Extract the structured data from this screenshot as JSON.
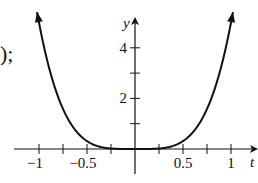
{
  "prefix_text": ");",
  "chart_data": {
    "type": "line",
    "title": "",
    "function": "y = 5t^4",
    "xlabel": "t",
    "ylabel": "y",
    "xlim": [
      -1.05,
      1.05
    ],
    "ylim": [
      0,
      5
    ],
    "x_ticks": [
      -1,
      -0.75,
      -0.5,
      -0.25,
      0.25,
      0.5,
      0.75,
      1
    ],
    "x_tick_labels": [
      "−1",
      "−0.5",
      "0.5",
      "1"
    ],
    "x_tick_label_values": [
      -1,
      -0.5,
      0.5,
      1
    ],
    "y_ticks": [
      1,
      2,
      3,
      4
    ],
    "y_tick_labels": [
      "2",
      "4"
    ],
    "y_tick_label_values": [
      2,
      4
    ],
    "grid": false,
    "legend": null,
    "series": [
      {
        "name": "curve",
        "x": [
          -1.0,
          -0.75,
          -0.5,
          -0.25,
          0,
          0.25,
          0.5,
          0.75,
          1.0
        ],
        "y": [
          5.0,
          1.58,
          0.31,
          0.02,
          0,
          0.02,
          0.31,
          1.58,
          5.0
        ]
      }
    ]
  }
}
